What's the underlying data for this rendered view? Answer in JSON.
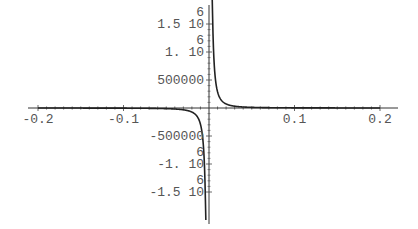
{
  "chart_data": {
    "type": "line",
    "title": "",
    "xlabel": "",
    "ylabel": "",
    "xlim": [
      -0.2,
      0.2
    ],
    "ylim": [
      -1800000,
      1800000
    ],
    "grid": false,
    "legend": null,
    "x_ticks": [
      {
        "value": -0.2,
        "label": "-0.2"
      },
      {
        "value": -0.1,
        "label": "-0.1"
      },
      {
        "value": 0.1,
        "label": "0.1"
      },
      {
        "value": 0.2,
        "label": "0.2"
      }
    ],
    "y_ticks": [
      {
        "value": 1500000,
        "label": "1.5 10",
        "exp": "6"
      },
      {
        "value": 1000000,
        "label": "1. 10",
        "exp": "6"
      },
      {
        "value": 500000,
        "label": "500000",
        "exp": ""
      },
      {
        "value": -500000,
        "label": "-500000",
        "exp": ""
      },
      {
        "value": -1000000,
        "label": "-1. 10",
        "exp": "6"
      },
      {
        "value": -1500000,
        "label": "-1.5 10",
        "exp": "6"
      }
    ],
    "series": [
      {
        "name": "f(x)",
        "color": "#222222",
        "x": [
          -0.2,
          -0.15,
          -0.1,
          -0.07,
          -0.05,
          -0.04,
          -0.03,
          -0.02,
          -0.015,
          -0.012,
          -0.01,
          -0.008,
          -0.007,
          -0.006,
          -0.005,
          -0.0045,
          -0.004,
          0.004,
          0.0045,
          0.005,
          0.006,
          0.007,
          0.008,
          0.01,
          0.012,
          0.015,
          0.02,
          0.03,
          0.04,
          0.05,
          0.07,
          0.1,
          0.15,
          0.2
        ],
        "y": [
          -725,
          -1289,
          -2900,
          -5918,
          -11600,
          -18125,
          -32222,
          -72500,
          -128889,
          -201389,
          -290000,
          -453125,
          -591837,
          -805556,
          -1160000,
          -1432099,
          -1812500,
          1812500,
          1432099,
          1160000,
          805556,
          591837,
          453125,
          290000,
          201389,
          128889,
          72500,
          32222,
          18125,
          11600,
          5918,
          2900,
          1289,
          725
        ]
      }
    ]
  },
  "plot": {
    "origin_px": [
      209,
      108
    ],
    "px_per_x_unit": 855,
    "px_per_y_unit": 5.6e-05
  }
}
